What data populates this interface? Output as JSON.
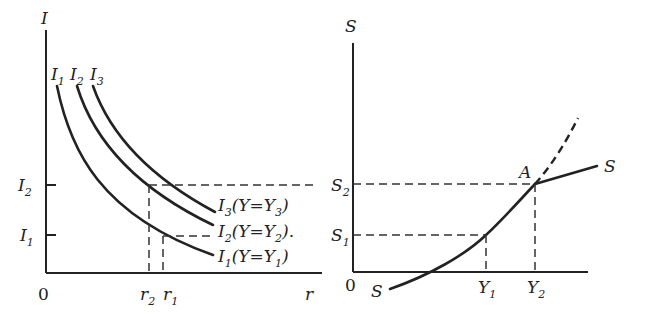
{
  "left_panel": {
    "y_axis_label": "I",
    "x_axis_label": "r",
    "origin_label": "0",
    "curve_top_labels": [
      {
        "base": "I",
        "sub": "1"
      },
      {
        "base": "I",
        "sub": "2"
      },
      {
        "base": "I",
        "sub": "3"
      }
    ],
    "y_ticks": [
      {
        "base": "I",
        "sub": "2"
      },
      {
        "base": "I",
        "sub": "1"
      }
    ],
    "x_ticks": [
      {
        "base": "r",
        "sub": "2"
      },
      {
        "base": "r",
        "sub": "1"
      }
    ],
    "curve_end_labels": [
      {
        "text": "I",
        "sub": "3",
        "paren": "(Y=Y",
        "paren_sub": "3",
        "close": ")"
      },
      {
        "text": "I",
        "sub": "2",
        "paren": "(Y=Y",
        "paren_sub": "2",
        "close": ")."
      },
      {
        "text": "I",
        "sub": "1",
        "paren": "(Y=Y",
        "paren_sub": "1",
        "close": ")"
      }
    ]
  },
  "right_panel": {
    "y_axis_label": "S",
    "origin_label": "0",
    "y_ticks": [
      {
        "base": "S",
        "sub": "2"
      },
      {
        "base": "S",
        "sub": "1"
      }
    ],
    "x_ticks": [
      {
        "base": "Y",
        "sub": "1"
      },
      {
        "base": "Y",
        "sub": "2"
      }
    ],
    "curve_start_label": "S",
    "curve_end_label": "S",
    "point_label": "A"
  },
  "colors": {
    "ink": "#222222",
    "background": "#ffffff"
  }
}
